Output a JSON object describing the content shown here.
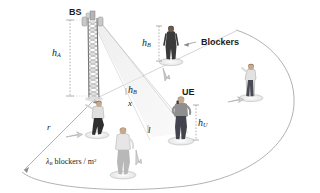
{
  "figure": {
    "background_color": "#ffffff",
    "ink_color": "#1b1b1b"
  },
  "labels": {
    "bs": "BS",
    "ue": "UE",
    "blockers": "Blockers",
    "h_a": "h",
    "h_a_sub": "A",
    "h_b": "h",
    "h_b_sub": "B",
    "h_u": "h",
    "h_u_sub": "U",
    "radius": "r",
    "x_dist": "x",
    "l_dist": "l",
    "density_lambda": "λ",
    "density_sub": "B",
    "density_rest": " blockers / m",
    "density_sup": "2"
  },
  "colors": {
    "tower": "#8d8d8d",
    "tower_dark": "#5a5a5a",
    "ground_arc": "#9a9a9a",
    "beam_fill": "#e9e9e9",
    "beam_edge": "#b9b9b9",
    "dim_line": "#9a9a9a",
    "shadow": "#d8d8d8",
    "person_dark": "#3a3a3a",
    "person_grey": "#8f8f8f",
    "person_light": "#cfcfcf",
    "skin": "#c9a98c",
    "hair": "#2e2e2e",
    "arrow": "#8a8a8a"
  },
  "elements": {
    "base_station": {
      "name": "BS",
      "type": "lattice-tower"
    },
    "user_equipment": {
      "name": "UE",
      "type": "person-with-phone"
    },
    "blocker_count_visible": 4,
    "coverage_area": {
      "type": "ellipse-sector",
      "radius_label": "r"
    }
  },
  "geometry": {
    "bs_x": 95,
    "bs_top_y": 14,
    "bs_base_y": 99,
    "ue_x": 182,
    "ue_base_y": 141,
    "arc_center_x": 95,
    "arc_center_y": 99
  }
}
